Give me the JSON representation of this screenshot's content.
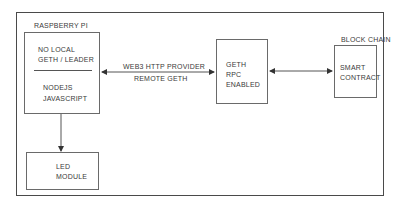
{
  "diagram": {
    "raspberry_pi": {
      "group_label": "RASPBERRY PI",
      "top_line1": "NO LOCAL",
      "top_line2": "GETH / LEADER",
      "bottom_line1": "NODEJS",
      "bottom_line2": "JAVASCRIPT"
    },
    "led": {
      "line1": "LED",
      "line2": "MODULE"
    },
    "connection_left": {
      "line1": "WEB3 HTTP PROVIDER",
      "line2": "REMOTE GETH"
    },
    "geth": {
      "line1": "GETH",
      "line2": "RPC",
      "line3": "ENABLED"
    },
    "blockchain": {
      "group_label": "BLOCK CHAIN",
      "line1": "SMART",
      "line2": "CONTRACT"
    }
  }
}
